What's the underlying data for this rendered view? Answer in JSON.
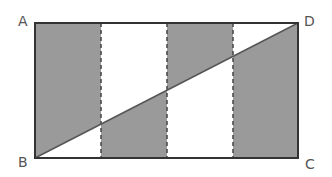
{
  "diagram": {
    "type": "geometry",
    "shape": "rectangle",
    "vertices": {
      "A": {
        "label": "A",
        "position": "top-left"
      },
      "B": {
        "label": "B",
        "position": "bottom-left"
      },
      "C": {
        "label": "C",
        "position": "bottom-right"
      },
      "D": {
        "label": "D",
        "position": "top-right"
      }
    },
    "diagonal": "BD",
    "strips": 4,
    "strip_divider_style": "dashed",
    "shading": [
      {
        "strip": 1,
        "shaded_region": "above-diagonal"
      },
      {
        "strip": 2,
        "shaded_region": "below-diagonal"
      },
      {
        "strip": 3,
        "shaded_region": "above-diagonal"
      },
      {
        "strip": 4,
        "shaded_region": "below-diagonal"
      }
    ],
    "colors": {
      "fill": "#9a9a9a",
      "outline": "#333333",
      "divider": "#444444",
      "label": "#555555"
    }
  }
}
